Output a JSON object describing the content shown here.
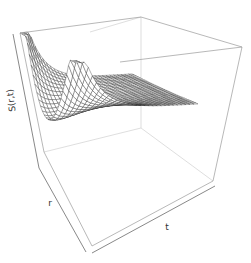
{
  "chart_data": {
    "type": "surface3d",
    "title": "",
    "xlabel": "t",
    "ylabel": "r",
    "zlabel": "S(r,t)",
    "style": "wireframe perspective box, no tick labels",
    "grid": {
      "nt": 30,
      "nr": 30
    },
    "colors": {
      "mesh_line": "#222222",
      "mesh_fill": "#ffffff",
      "box": "#9a9a9a",
      "background": "#ffffff"
    }
  },
  "labels": {
    "z_axis": "S(r,t)",
    "r_axis": "r",
    "t_axis": "t"
  }
}
